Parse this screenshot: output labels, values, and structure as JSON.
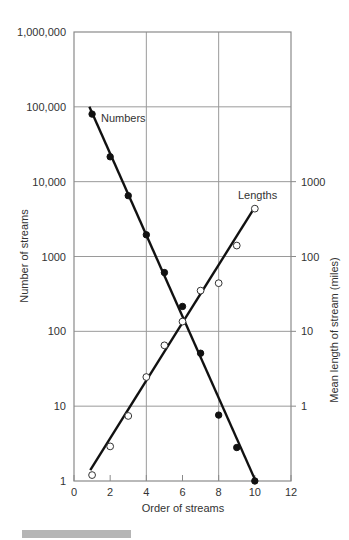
{
  "chart_data": {
    "type": "scatter",
    "title": "",
    "xlabel": "Order of streams",
    "ylabel_left": "Number of streams",
    "ylabel_right": "Mean length of stream (miles)",
    "x_ticks": [
      0,
      2,
      4,
      6,
      8,
      10,
      12
    ],
    "xlim": [
      0,
      12
    ],
    "y_left_scale": "log",
    "y_left_ticks": [
      "1",
      "10",
      "100",
      "1000",
      "10,000",
      "100,000",
      "1,000,000"
    ],
    "y_left_tick_values": [
      1,
      10,
      100,
      1000,
      10000,
      100000,
      1000000
    ],
    "ylim_left": [
      1,
      1000000
    ],
    "y_right_scale": "log",
    "y_right_ticks": [
      "1",
      "10",
      "100",
      "1000"
    ],
    "y_right_tick_values": [
      1,
      10,
      100,
      1000
    ],
    "ylim_right": [
      0.1,
      100000
    ],
    "grid": {
      "x": [
        4,
        8
      ],
      "y_left": [
        10,
        100,
        1000,
        10000,
        100000
      ]
    },
    "x": [
      1,
      2,
      3,
      4,
      5,
      6,
      7,
      8,
      9,
      10
    ],
    "series": [
      {
        "name": "Numbers",
        "axis": "left",
        "marker": "filled-circle",
        "values": [
          80000,
          21500,
          6500,
          1950,
          610,
          215,
          51,
          7.6,
          2.8,
          1.0
        ],
        "fit_line": {
          "from": [
            0.85,
            100000
          ],
          "to": [
            10.1,
            0.93
          ]
        },
        "label_pos": [
          101,
          122
        ]
      },
      {
        "name": "Lengths",
        "axis": "right",
        "marker": "open-circle",
        "values": [
          0.12,
          0.29,
          0.74,
          2.45,
          6.5,
          13.5,
          35,
          44,
          140,
          436
        ],
        "fit_line": {
          "from": [
            0.9,
            0.14
          ],
          "to": [
            10.0,
            458
          ]
        },
        "label_pos": [
          238,
          199
        ]
      }
    ]
  },
  "footer": {
    "bar_color": "#b5b5b5"
  }
}
